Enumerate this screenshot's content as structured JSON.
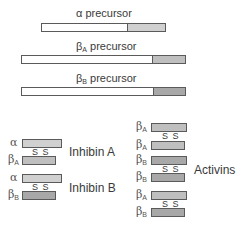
{
  "colors": {
    "background": "#ffffff",
    "border": "#5a5a5a",
    "propeptide": "#ffffff",
    "alpha_mature": "#d0d0d0",
    "betaA_mature": "#bfbfbf",
    "betaB_mature": "#a8a8a8"
  },
  "precursors": [
    {
      "greek": "α",
      "sub": "",
      "label": "precursor",
      "x": 41,
      "y": 23,
      "width": 125,
      "split": 85
    },
    {
      "greek": "β",
      "sub": "A",
      "label": "precursor",
      "x": 21,
      "y": 55,
      "width": 165,
      "split": 130
    },
    {
      "greek": "β",
      "sub": "B",
      "label": "precursor",
      "x": 21,
      "y": 87,
      "width": 165,
      "split": 131
    }
  ],
  "inhibins": [
    {
      "name": "Inhibin A",
      "top": {
        "greek": "α",
        "sub": ""
      },
      "bottom": {
        "greek": "β",
        "sub": "A"
      },
      "bond": "S S"
    },
    {
      "name": "Inhibin B",
      "top": {
        "greek": "α",
        "sub": ""
      },
      "bottom": {
        "greek": "β",
        "sub": "B"
      },
      "bond": "S S"
    }
  ],
  "activins": {
    "name": "Activins",
    "pairs": [
      {
        "top": {
          "greek": "β",
          "sub": "A"
        },
        "bottom": {
          "greek": "β",
          "sub": "A"
        },
        "bond": "S S"
      },
      {
        "top": {
          "greek": "β",
          "sub": "B"
        },
        "bottom": {
          "greek": "β",
          "sub": "B"
        },
        "bond": "S S"
      },
      {
        "top": {
          "greek": "β",
          "sub": "A"
        },
        "bottom": {
          "greek": "β",
          "sub": "B"
        },
        "bond": "S S"
      }
    ]
  }
}
